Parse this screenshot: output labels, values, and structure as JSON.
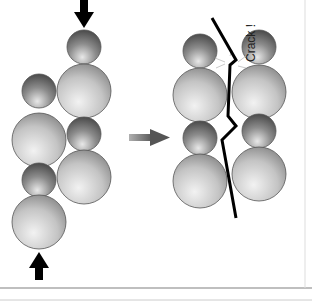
{
  "diagram": {
    "crack_label": "Crack !",
    "colors": {
      "sphere_light": "#e4e4e4",
      "sphere_dark": "#6a6a6a",
      "arrow": "#000000",
      "crack": "#000000",
      "transition_arrow": "#777777",
      "frame": "#999999"
    }
  }
}
